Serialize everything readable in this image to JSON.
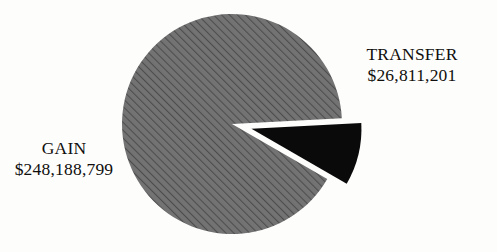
{
  "figure": {
    "width": 497,
    "height": 252,
    "background_color": "#fdfdfc"
  },
  "chart_data": {
    "type": "pie",
    "title": "",
    "subtitle": "",
    "xlabel": "",
    "ylabel": "",
    "grid": false,
    "legend_position": "none",
    "label_style": "outside-direct-labels",
    "total": 275000000,
    "center": {
      "x": 232,
      "y": 124
    },
    "radius": 110,
    "categories": [
      "GAIN",
      "TRANSFER"
    ],
    "values": [
      248188799,
      26811201
    ],
    "value_labels": [
      "$248,188,799",
      "$26,811,201"
    ],
    "percentages": [
      90.25,
      9.75
    ],
    "slices": [
      {
        "name": "GAIN",
        "value": 248188799,
        "value_label": "$248,188,799",
        "percent": 90.25,
        "fill_color": "#737373",
        "hatch": "diagonal-forward-lines",
        "hatch_color": "#4c4c4c",
        "exploded": false,
        "start_angle_deg": 3,
        "end_angle_deg": 330
      },
      {
        "name": "TRANSFER",
        "value": 26811201,
        "value_label": "$26,811,201",
        "percent": 9.75,
        "fill_color": "#0a0a0a",
        "hatch": "solid",
        "exploded": true,
        "explode_offset_px": 20,
        "start_angle_deg": 330,
        "end_angle_deg": 3
      }
    ]
  },
  "labels": {
    "transfer": {
      "name": "TRANSFER",
      "value": "$26,811,201"
    },
    "gain": {
      "name": "GAIN",
      "value": "$248,188,799"
    }
  }
}
